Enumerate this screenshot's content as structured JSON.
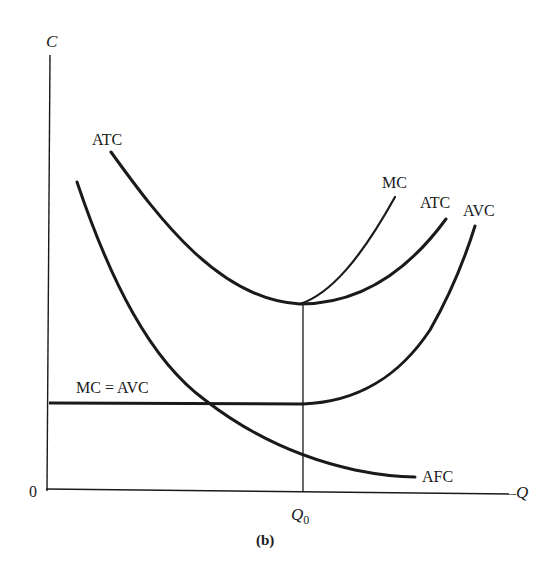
{
  "diagram": {
    "type": "cost-curves",
    "panel_label": "(b)",
    "axes": {
      "y_label": "C",
      "x_label": "Q",
      "origin_label": "0",
      "x_marker": "Q",
      "x_marker_subscript": "0"
    },
    "curves": [
      {
        "name": "ATC",
        "label": "ATC",
        "description": "Average total cost, U-shaped, minimum at Q0"
      },
      {
        "name": "ATC-right",
        "label": "ATC",
        "description": "Right branch label of ATC curve"
      },
      {
        "name": "MC",
        "label": "MC",
        "description": "Marginal cost, rises steeply from ATC minimum at Q0"
      },
      {
        "name": "AVC",
        "label": "AVC",
        "description": "Average variable cost, flat then rising after Q0"
      },
      {
        "name": "AFC",
        "label": "AFC",
        "description": "Average fixed cost, declining hyperbola"
      },
      {
        "name": "MC-AVC-flat",
        "label": "MC = AVC",
        "description": "Horizontal segment where MC equals AVC up to Q0"
      }
    ],
    "colors": {
      "curve": "#1a1a1a",
      "axis": "#1a1a1a",
      "background": "#ffffff"
    }
  }
}
